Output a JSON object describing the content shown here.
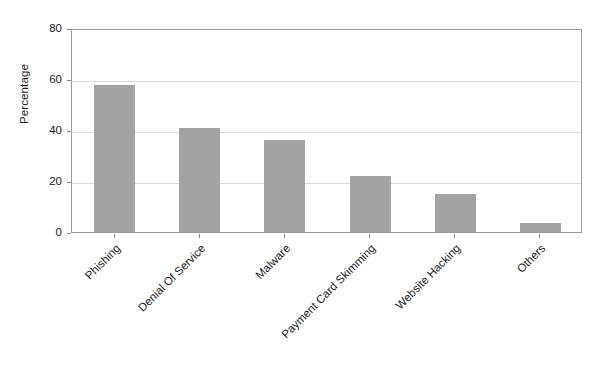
{
  "chart_data": {
    "type": "bar",
    "title": "",
    "subtitle": "",
    "xlabel": "",
    "ylabel": "Percentage",
    "categories": [
      "Phishing",
      "Denial Of Service",
      "Malware",
      "Payment Card Skimming",
      "Website Hacking",
      "Others"
    ],
    "values": [
      57.5,
      41,
      36,
      22,
      15,
      3.5
    ],
    "ylim": [
      0,
      80
    ],
    "yticks": [
      0,
      20,
      40,
      60,
      80
    ],
    "ytick_labels": [
      "0",
      "20",
      "40",
      "60",
      "80"
    ],
    "grid": "horizontal",
    "legend": "none",
    "bar_color": "#a3a3a3",
    "gridline_color": "#d9d9d9",
    "axis_color": "#9a9a9a",
    "background_color": "#ffffff",
    "xtick_label_rotation": 45
  },
  "figure": {
    "ylabel_text": "Percentage"
  }
}
